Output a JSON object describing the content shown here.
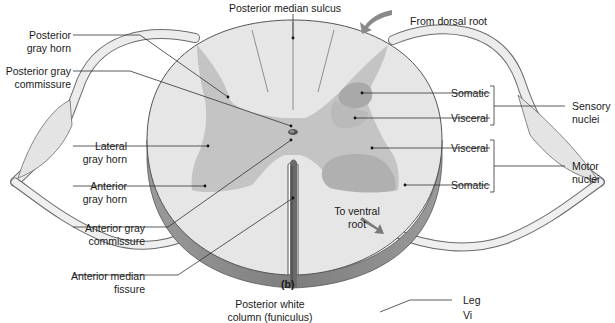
{
  "figure": {
    "panel_label": "(b)",
    "colors": {
      "white_matter": "#e6e6e6",
      "gray_matter": "#c4c4c4",
      "somatic_sensory": "#a9a9a9",
      "visceral_sensory": "#bcbcbc",
      "somatic_motor": "#b2b2b2",
      "cord_side": "#8e8e8e",
      "nerve_root": "#ececec",
      "outline": "#5a5a5a"
    },
    "labels": {
      "posterior_median_sulcus": "Posterior median sulcus",
      "from_dorsal_root": "From dorsal root",
      "posterior_gray_horn": [
        "Posterior",
        "gray horn"
      ],
      "posterior_gray_commissure": [
        "Posterior gray",
        "commissure"
      ],
      "lateral_gray_horn": [
        "Lateral",
        "gray horn"
      ],
      "anterior_gray_horn": [
        "Anterior",
        "gray horn"
      ],
      "anterior_gray_commissure": [
        "Anterior gray",
        "commissure"
      ],
      "anterior_median_fissure": [
        "Anterior median",
        "fissure"
      ],
      "to_ventral_root": [
        "To ventral",
        "root"
      ],
      "somatic_sensory": "Somatic",
      "visceral_sensory": "Visceral",
      "visceral_motor": "Visceral",
      "somatic_motor": "Somatic",
      "sensory_nuclei": [
        "Sensory",
        "nuclei"
      ],
      "motor_nuclei": [
        "Motor",
        "nuclei"
      ],
      "posterior_white_column": [
        "Posterior white",
        "column (funiculus)"
      ],
      "leg": "Leg",
      "cut_off_next": "Vi"
    }
  }
}
